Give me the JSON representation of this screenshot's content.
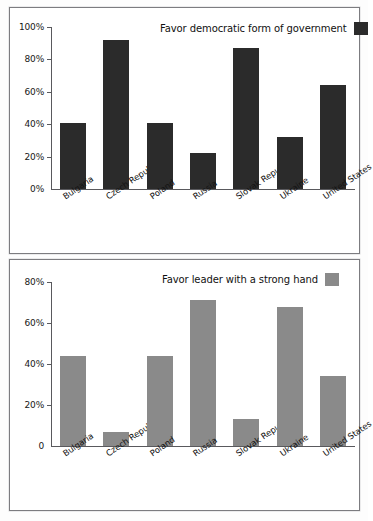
{
  "figure": {
    "panels": [
      {
        "id": "democracy",
        "legend_label": "Favor democratic form of government",
        "series_color": "#2b2b2b"
      },
      {
        "id": "strong-hand",
        "legend_label": "Favor leader with a strong hand",
        "series_color": "#8a8a8a"
      }
    ]
  },
  "chart_data": [
    {
      "type": "bar",
      "title": "Favor democratic form of government",
      "xlabel": "",
      "ylabel": "",
      "categories": [
        "Bulgaria",
        "Czech Republic",
        "Poland",
        "Russia",
        "Slovak Republic",
        "Ukraine",
        "United States"
      ],
      "values": [
        41,
        92,
        41,
        22,
        87,
        32,
        64
      ],
      "ylim": [
        0,
        100
      ],
      "yticks": [
        0,
        20,
        40,
        60,
        80,
        100
      ],
      "ytick_labels": [
        "0%",
        "20%",
        "40%",
        "60%",
        "80%",
        "100%"
      ],
      "grid": false,
      "legend_position": "top-right",
      "legend_entries": [
        "Favor democratic form of government"
      ],
      "bar_color": "#2b2b2b"
    },
    {
      "type": "bar",
      "title": "Favor leader with a strong hand",
      "xlabel": "",
      "ylabel": "",
      "categories": [
        "Bulgaria",
        "Czech Republic",
        "Poland",
        "Russia",
        "Slovak Republic",
        "Ukraine",
        "United States"
      ],
      "values": [
        44,
        7,
        44,
        71,
        13,
        68,
        34
      ],
      "ylim": [
        0,
        80
      ],
      "yticks": [
        0,
        20,
        40,
        60,
        80
      ],
      "ytick_labels": [
        "0",
        "20%",
        "40%",
        "60%",
        "80%"
      ],
      "grid": false,
      "legend_position": "top-right",
      "legend_entries": [
        "Favor leader with a strong hand"
      ],
      "bar_color": "#8a8a8a"
    }
  ]
}
